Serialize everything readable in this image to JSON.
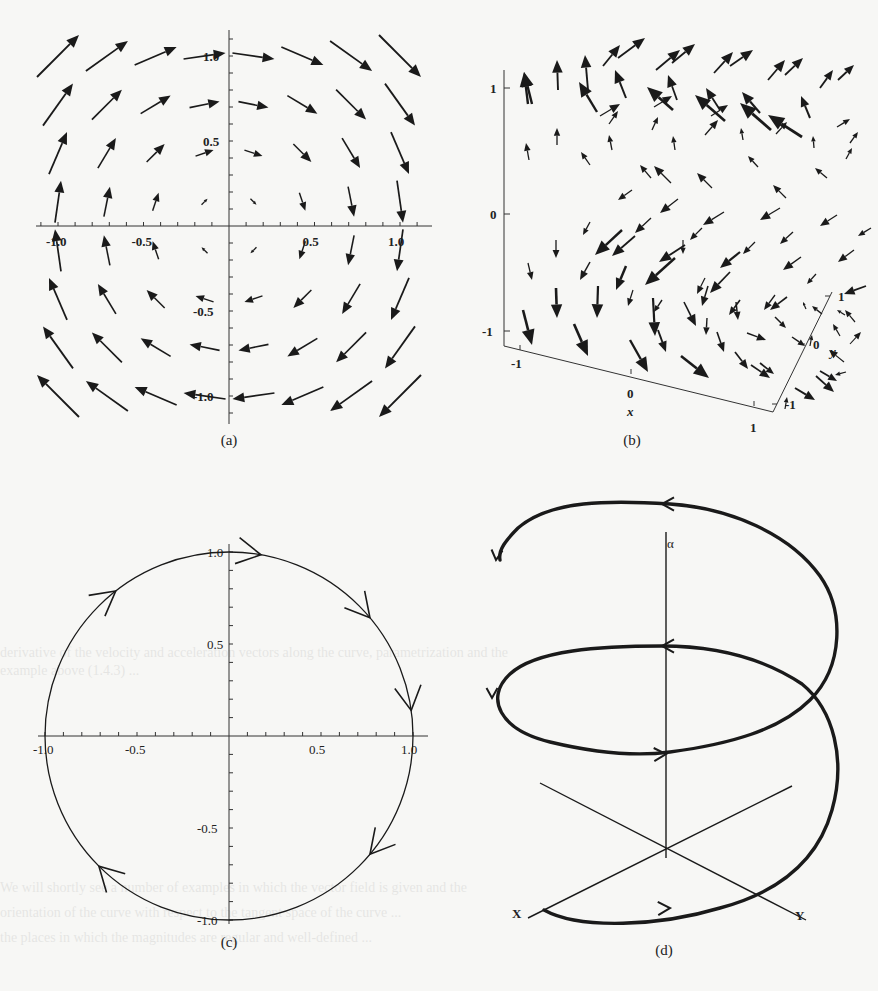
{
  "figure": {
    "panels": [
      {
        "id": "a",
        "caption": "(a)",
        "type": "2d-vector-field",
        "description": "Vector field F(x,y) = (y, -x), clockwise rotation"
      },
      {
        "id": "b",
        "caption": "(b)",
        "type": "3d-vector-field"
      },
      {
        "id": "c",
        "caption": "(c)",
        "type": "parametric-curve",
        "description": "Unit circle traversed clockwise"
      },
      {
        "id": "d",
        "caption": "(d)",
        "type": "helix-sketch"
      }
    ]
  },
  "panel_a": {
    "caption": "(a)",
    "x_ticks": [
      "-1.0",
      "-0.5",
      "0.5",
      "1.0"
    ],
    "y_ticks": [
      "1.0",
      "0.5",
      "-0.5",
      "-1.0"
    ],
    "grid_x": [
      -1.0,
      -0.714,
      -0.429,
      -0.143,
      0.143,
      0.429,
      0.714,
      1.0
    ],
    "grid_y": [
      1.0,
      0.714,
      0.429,
      0.143,
      -0.143,
      -0.429,
      -0.714,
      -1.0
    ]
  },
  "panel_b": {
    "caption": "(b)",
    "z_ticks": [
      "1",
      "0",
      "-1"
    ],
    "x_ticks": [
      "-1",
      "0",
      "1"
    ],
    "y_ticks": [
      "-1",
      "0",
      "1"
    ],
    "x_label": "x",
    "y_label": "y"
  },
  "panel_c": {
    "caption": "(c)",
    "x_ticks": [
      "-1.0",
      "-0.5",
      "0.5",
      "1.0"
    ],
    "y_ticks": [
      "1.0",
      "0.5",
      "-0.5",
      "-1.0"
    ],
    "direction": "clockwise"
  },
  "panel_d": {
    "caption": "(d)",
    "axis_labels": {
      "vertical": "α",
      "left": "X",
      "right": "Y"
    }
  },
  "chart_data": [
    {
      "type": "vector-field",
      "title": "(a)",
      "field": "F(x,y) = (y, -x)",
      "xlim": [
        -1.1,
        1.1
      ],
      "ylim": [
        -1.1,
        1.1
      ],
      "x_ticks": [
        -1.0,
        -0.5,
        0.5,
        1.0
      ],
      "y_ticks": [
        -1.0,
        -0.5,
        0.5,
        1.0
      ],
      "grid": "8x8 sample points from -1 to 1"
    },
    {
      "type": "vector-field-3d",
      "title": "(b)",
      "xlabel": "x",
      "ylabel": "y",
      "x_ticks": [
        -1,
        0,
        1
      ],
      "y_ticks": [
        -1,
        0,
        1
      ],
      "z_ticks": [
        -1,
        0,
        1
      ]
    },
    {
      "type": "line",
      "title": "(c)",
      "curve": "x = sin t, y = cos t (unit circle, clockwise)",
      "xlim": [
        -1.0,
        1.0
      ],
      "ylim": [
        -1.0,
        1.0
      ],
      "x_ticks": [
        -1.0,
        -0.5,
        0.5,
        1.0
      ],
      "y_ticks": [
        -1.0,
        -0.5,
        0.5,
        1.0
      ],
      "arrow_count": 6
    },
    {
      "type": "diagram",
      "title": "(d)",
      "description": "Helix winding about vertical axis α with X and Y axes at base",
      "labels": [
        "α",
        "X",
        "Y"
      ]
    }
  ]
}
